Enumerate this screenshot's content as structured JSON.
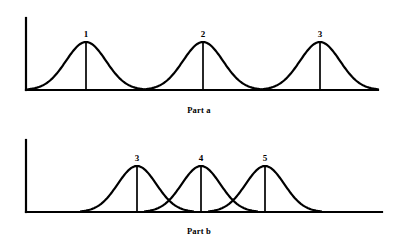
{
  "figure": {
    "background_color": "#ffffff",
    "ink_color": "#000000",
    "width": 398,
    "height": 250
  },
  "panels": [
    {
      "id": "part-a",
      "caption": "Part a",
      "axis": {
        "origin_x": 26,
        "origin_y": 90,
        "y_axis_top": 18,
        "x_axis_right": 378,
        "stroke_width": 2.2
      },
      "curves": [
        {
          "label": "1",
          "peak_x": 86,
          "peak_y": 42,
          "half_width": 58,
          "label_x": 86,
          "label_y": 29
        },
        {
          "label": "2",
          "peak_x": 203,
          "peak_y": 42,
          "half_width": 58,
          "label_x": 203,
          "label_y": 29
        },
        {
          "label": "3",
          "peak_x": 320,
          "peak_y": 42,
          "half_width": 58,
          "label_x": 320,
          "label_y": 29
        }
      ]
    },
    {
      "id": "part-b",
      "caption": "Part b",
      "axis": {
        "origin_x": 26,
        "origin_y": 212,
        "y_axis_top": 140,
        "x_axis_right": 382,
        "stroke_width": 2.2
      },
      "curves": [
        {
          "label": "3",
          "peak_x": 137,
          "peak_y": 166,
          "half_width": 56,
          "label_x": 137,
          "label_y": 153
        },
        {
          "label": "4",
          "peak_x": 201,
          "peak_y": 166,
          "half_width": 56,
          "label_x": 201,
          "label_y": 153
        },
        {
          "label": "5",
          "peak_x": 265,
          "peak_y": 166,
          "half_width": 56,
          "label_x": 265,
          "label_y": 153
        }
      ]
    }
  ],
  "chart_data": {
    "type": "line",
    "title": "",
    "xlabel": "",
    "ylabel": "",
    "grid": false,
    "legend": null,
    "subplots": [
      {
        "name": "Part a",
        "note": "Three non-overlapping normal curves of equal height and equal spread; the tails meet the baseline between curves.",
        "series": [
          {
            "name": "1",
            "mean": 1,
            "peak_height": 1.0,
            "spread": 1.0
          },
          {
            "name": "2",
            "mean": 2,
            "peak_height": 1.0,
            "spread": 1.0
          },
          {
            "name": "3",
            "mean": 3,
            "peak_height": 1.0,
            "spread": 1.0
          }
        ],
        "x": [
          1,
          2,
          3
        ],
        "values": [
          1.0,
          1.0,
          1.0
        ]
      },
      {
        "name": "Part b",
        "note": "Three overlapping normal curves of equal height and equal spread; adjacent curves intersect well above the baseline.",
        "series": [
          {
            "name": "3",
            "mean": 3,
            "peak_height": 1.0,
            "spread": 1.0
          },
          {
            "name": "4",
            "mean": 4,
            "peak_height": 1.0,
            "spread": 1.0
          },
          {
            "name": "5",
            "mean": 5,
            "peak_height": 1.0,
            "spread": 1.0
          }
        ],
        "x": [
          3,
          4,
          5
        ],
        "values": [
          1.0,
          1.0,
          1.0
        ]
      }
    ]
  }
}
